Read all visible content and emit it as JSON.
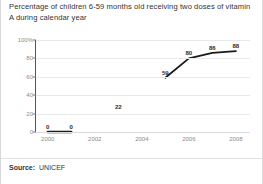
{
  "title": "Percentage of children 6-59 months old receiving two doses of vitamin A during calendar year",
  "source": {
    "label": "Source:",
    "value": "UNICEF"
  },
  "colors": {
    "line": "#1a1a1a",
    "grid": "#e9e9e9",
    "axis": "#555555",
    "tick_text": "#8a8a8a",
    "label_text": "#2b2b2b",
    "card_border": "#d8d8d8",
    "background": "#ffffff"
  },
  "chart_data": {
    "type": "line",
    "title": "Percentage of children 6-59 months old receiving two doses of vitamin A during calendar year",
    "xlabel": "",
    "ylabel": "",
    "x": [
      2000,
      2001,
      2002,
      2003,
      2004,
      2005,
      2006,
      2007,
      2008
    ],
    "values": [
      0,
      0,
      null,
      22,
      null,
      59,
      80,
      86,
      88
    ],
    "point_labels": [
      {
        "x": 2000,
        "y": 0,
        "text": "0"
      },
      {
        "x": 2001,
        "y": 0,
        "text": "0"
      },
      {
        "x": 2003,
        "y": 22,
        "text": "22"
      },
      {
        "x": 2005,
        "y": 59,
        "text": "59"
      },
      {
        "x": 2006,
        "y": 80,
        "text": "80"
      },
      {
        "x": 2007,
        "y": 86,
        "text": "86"
      },
      {
        "x": 2008,
        "y": 88,
        "text": "88"
      }
    ],
    "segments": [
      [
        {
          "x": 2000,
          "y": 0
        },
        {
          "x": 2001,
          "y": 0
        }
      ],
      [
        {
          "x": 2005,
          "y": 59
        },
        {
          "x": 2006,
          "y": 80
        },
        {
          "x": 2007,
          "y": 86
        },
        {
          "x": 2008,
          "y": 88
        }
      ]
    ],
    "xlim": [
      1999.5,
      2008.6
    ],
    "ylim": [
      0,
      100
    ],
    "xticks": [
      2000,
      2002,
      2004,
      2006,
      2008
    ],
    "xticklabels": [
      "2000",
      "2002",
      "2004",
      "2006",
      "2008"
    ],
    "yticks": [
      0,
      20,
      40,
      60,
      80,
      100
    ],
    "yticklabels": [
      "0",
      "20",
      "40",
      "60",
      "80",
      "100%"
    ],
    "grid": true,
    "legend": false
  }
}
